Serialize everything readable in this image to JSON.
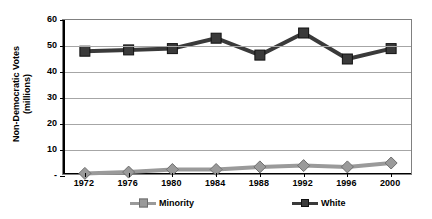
{
  "chart_data": {
    "type": "line",
    "title": "",
    "xlabel": "",
    "ylabel": "Non-Democratic Votes (millions)",
    "ylabel_line1": "Non-Democratic Votes",
    "ylabel_line2": "(millions)",
    "categories": [
      "1972",
      "1976",
      "1980",
      "1984",
      "1988",
      "1992",
      "1996",
      "2000"
    ],
    "x": [
      1972,
      1976,
      1980,
      1984,
      1988,
      1992,
      1996,
      2000
    ],
    "ylim": [
      0,
      60
    ],
    "yticks": [
      "-",
      "10",
      "20",
      "30",
      "40",
      "50",
      "60"
    ],
    "ytick_values": [
      0,
      10,
      20,
      30,
      40,
      50,
      60
    ],
    "grid": true,
    "legend_position": "bottom",
    "series": [
      {
        "name": "Minority",
        "color": "#9a9a9a",
        "marker": "diamond",
        "values": [
          1.0,
          1.5,
          2.5,
          2.5,
          3.5,
          4.0,
          3.5,
          5.0
        ]
      },
      {
        "name": "White",
        "color": "#3a3a3a",
        "marker": "square",
        "values": [
          48.0,
          48.5,
          49.0,
          53.0,
          46.5,
          55.0,
          45.0,
          49.0
        ]
      }
    ]
  },
  "legend": {
    "items": [
      {
        "label": "Minority"
      },
      {
        "label": "White"
      }
    ]
  },
  "colors": {
    "minority": "#9a9a9a",
    "white": "#3a3a3a",
    "grid": "#a6a6a6",
    "axis": "#000000",
    "frame": "#808080",
    "background": "#ffffff"
  }
}
